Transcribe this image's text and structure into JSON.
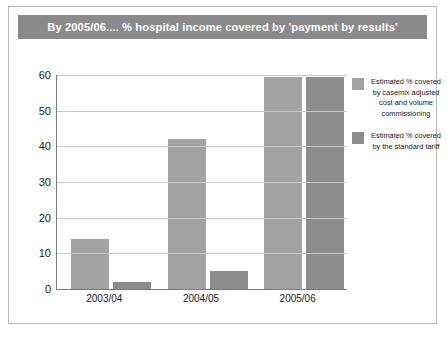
{
  "slide": {
    "title": "By 2005/06.... % hospital income covered by 'payment by results'",
    "title_bar_color": "#8a8a8a",
    "title_text_color": "#ffffff",
    "border_color": "#b9b9b9",
    "background_color": "#ffffff"
  },
  "chart_data": {
    "type": "bar",
    "title": "By 2005/06.... % hospital income covered by 'payment by results'",
    "xlabel": "",
    "ylabel": "",
    "ylim": [
      0,
      60
    ],
    "yticks": [
      0,
      10,
      20,
      30,
      40,
      50,
      60
    ],
    "grid": true,
    "legend_position": "right",
    "categories": [
      "2003/04",
      "2004/05",
      "2005/06"
    ],
    "series": [
      {
        "name": "Estimated % covered by casemix adjusted cost and volume commissioning",
        "color": "#a3a3a3",
        "values": [
          14,
          42,
          59.5
        ]
      },
      {
        "name": "Estimated % covered by the standard tariff",
        "color": "#8d8d8d",
        "values": [
          2,
          5,
          59.5
        ]
      }
    ]
  }
}
